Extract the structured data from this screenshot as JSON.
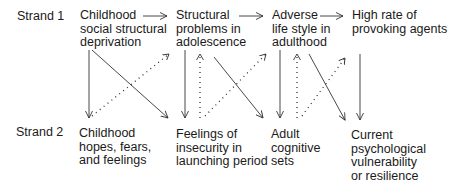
{
  "strands": [
    {
      "label": "Strand 1"
    },
    {
      "label": "Strand 2"
    }
  ],
  "strand1_nodes": [
    {
      "lines": [
        "Childhood",
        "social structural",
        "deprivation"
      ]
    },
    {
      "lines": [
        "Structural",
        "problems in",
        "adolescence"
      ]
    },
    {
      "lines": [
        "Adverse",
        "life style in",
        "adulthood"
      ]
    },
    {
      "lines": [
        "High rate of",
        "provoking agents"
      ]
    }
  ],
  "strand2_nodes": [
    {
      "lines": [
        "Childhood",
        "hopes, fears,",
        "and feelings"
      ]
    },
    {
      "lines": [
        "Feelings of",
        "insecurity in",
        "launching period"
      ]
    },
    {
      "lines": [
        "Adult",
        "cognitive",
        "sets"
      ]
    },
    {
      "lines": [
        "Current",
        "psychological",
        "vulnerability",
        "or resilience"
      ]
    }
  ],
  "edges": [
    {
      "from": "strand1.0",
      "to": "strand1.1",
      "style": "solid"
    },
    {
      "from": "strand1.1",
      "to": "strand1.2",
      "style": "solid"
    },
    {
      "from": "strand1.2",
      "to": "strand1.3",
      "style": "solid"
    },
    {
      "from": "strand1.0",
      "to": "strand2.0",
      "style": "solid"
    },
    {
      "from": "strand1.0",
      "to": "strand2.1",
      "style": "solid"
    },
    {
      "from": "strand2.0",
      "to": "strand1.1",
      "style": "dotted"
    },
    {
      "from": "strand1.1",
      "to": "strand2.1",
      "style": "solid"
    },
    {
      "from": "strand2.1",
      "to": "strand1.1",
      "style": "dotted"
    },
    {
      "from": "strand1.1",
      "to": "strand2.2",
      "style": "solid"
    },
    {
      "from": "strand2.1",
      "to": "strand1.2",
      "style": "dotted"
    },
    {
      "from": "strand1.2",
      "to": "strand2.2",
      "style": "solid"
    },
    {
      "from": "strand2.2",
      "to": "strand1.2",
      "style": "dotted"
    },
    {
      "from": "strand1.2",
      "to": "strand2.3",
      "style": "solid"
    },
    {
      "from": "strand2.2",
      "to": "strand1.3",
      "style": "dotted"
    },
    {
      "from": "strand1.3",
      "to": "strand2.3",
      "style": "solid"
    }
  ]
}
